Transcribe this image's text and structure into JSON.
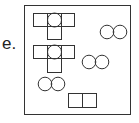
{
  "option": {
    "label": "e."
  },
  "figure": {
    "frame": {
      "x": 24,
      "y": 5,
      "w": 106,
      "h": 109
    },
    "stroke": "#333333",
    "t_shapes": [
      {
        "x": 33,
        "y": 13
      },
      {
        "x": 33,
        "y": 45
      }
    ],
    "circle_pairs": [
      {
        "x": 100,
        "y": 25
      },
      {
        "x": 82,
        "y": 55
      },
      {
        "x": 38,
        "y": 77
      }
    ],
    "rect_pairs": [
      {
        "x": 68,
        "y": 93
      }
    ]
  }
}
